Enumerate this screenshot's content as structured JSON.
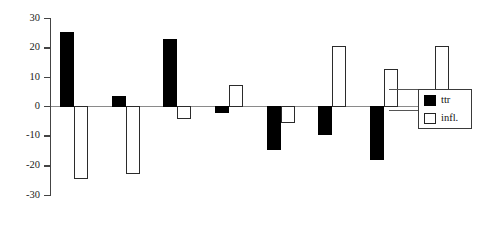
{
  "chart_data": {
    "type": "bar",
    "title": "",
    "subtitle": "",
    "xlabel": "",
    "ylabel": "",
    "ylim": [
      -30,
      30
    ],
    "yticks": [
      30,
      20,
      10,
      0,
      -10,
      -20,
      -30
    ],
    "ytick_labels": [
      "30",
      "20",
      "10",
      "0",
      "-10",
      "-20",
      "-30"
    ],
    "grid": false,
    "legend_position": "right",
    "categories": [
      "1",
      "2",
      "3",
      "4",
      "5",
      "6",
      "7",
      "8"
    ],
    "xtick_labels": [
      "",
      "",
      "",
      "",
      "",
      "",
      "",
      ""
    ],
    "series": [
      {
        "name": "ttr",
        "color": "#000000",
        "fill": "solid",
        "values": [
          25.0,
          3.5,
          22.8,
          -2.0,
          -14.5,
          -9.5,
          -18.0,
          -5.0
        ]
      },
      {
        "name": "infl.",
        "color": "#ffffff",
        "fill": "open",
        "values": [
          -24.5,
          -22.8,
          -4.0,
          7.0,
          -5.5,
          20.5,
          12.5,
          20.5
        ]
      }
    ],
    "annotations": []
  },
  "legend": {
    "entries": [
      {
        "label": "ttr",
        "swatch": "black-filled-square"
      },
      {
        "label": "infl.",
        "swatch": "white-open-square"
      }
    ]
  },
  "axis": {
    "zero_line_value": "0",
    "y_axis_name": "y-axis"
  }
}
